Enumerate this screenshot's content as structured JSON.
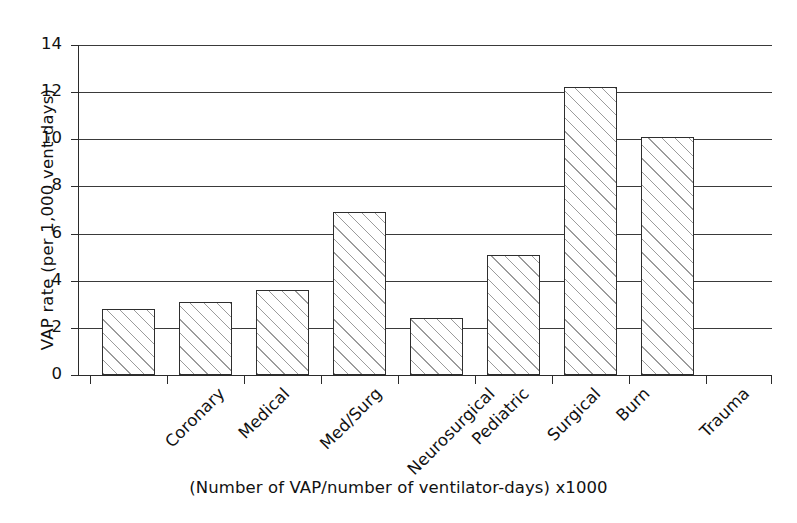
{
  "chart_data": {
    "type": "bar",
    "title": "",
    "subtitle": "",
    "xlabel": "",
    "ylabel": "VAP rate (per 1,000 vent-days)",
    "caption": "(Number of VAP/number of ventilator-days) x1000",
    "categories": [
      "Coronary",
      "Medical",
      "Med/Surg",
      "Neurosurgical",
      "Pediatric",
      "Surgical",
      "Burn",
      "Trauma"
    ],
    "values": [
      2.8,
      3.1,
      3.6,
      6.9,
      2.4,
      5.1,
      12.2,
      10.1
    ],
    "ylim": [
      0,
      14
    ],
    "ytick_labels": [
      "0",
      "2",
      "4",
      "6",
      "8",
      "10",
      "12",
      "14"
    ],
    "ytick_values": [
      0,
      2,
      4,
      6,
      8,
      10,
      12,
      14
    ],
    "grid": "horizontal",
    "legend": "none",
    "bar_fill": "diagonal-hatch",
    "bar_edge_color": "#2e2e2e",
    "hatch_color": "#969696",
    "axis_color": "#2b2b2b",
    "background_color": "#ffffff"
  }
}
